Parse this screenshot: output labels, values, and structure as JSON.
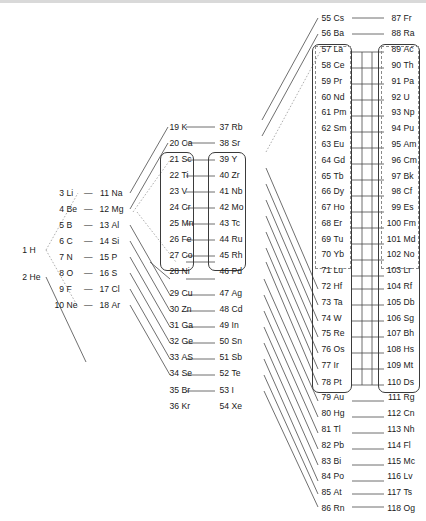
{
  "diagram": {
    "type": "element-chain-diagram",
    "background": "#ffffff",
    "line_color": "#4a4a4a",
    "dashed_line_color": "#9a9a9a",
    "box_color": "#3b3b3b"
  },
  "columns": [
    {
      "id": "col-s1",
      "name": "hydrogen-helium-column",
      "elements": [
        {
          "z": "1",
          "symbol": "H"
        },
        {
          "z": "2",
          "symbol": "He"
        }
      ]
    },
    {
      "id": "col-period2",
      "name": "period-2-column",
      "elements": [
        {
          "z": "3",
          "symbol": "Li"
        },
        {
          "z": "4",
          "symbol": "Be"
        },
        {
          "z": "5",
          "symbol": "B"
        },
        {
          "z": "6",
          "symbol": "C"
        },
        {
          "z": "7",
          "symbol": "N"
        },
        {
          "z": "8",
          "symbol": "O"
        },
        {
          "z": "9",
          "symbol": "F"
        },
        {
          "z": "10",
          "symbol": "Ne"
        }
      ]
    },
    {
      "id": "col-period3",
      "name": "period-3-column",
      "elements": [
        {
          "z": "11",
          "symbol": "Na"
        },
        {
          "z": "12",
          "symbol": "Mg"
        },
        {
          "z": "13",
          "symbol": "Al"
        },
        {
          "z": "14",
          "symbol": "Si"
        },
        {
          "z": "15",
          "symbol": "P"
        },
        {
          "z": "16",
          "symbol": "S"
        },
        {
          "z": "17",
          "symbol": "Cl"
        },
        {
          "z": "18",
          "symbol": "Ar"
        }
      ]
    },
    {
      "id": "col-period4",
      "name": "period-4-column",
      "elements": [
        {
          "z": "19",
          "symbol": "K"
        },
        {
          "z": "20",
          "symbol": "Ca"
        },
        {
          "z": "21",
          "symbol": "Sc"
        },
        {
          "z": "22",
          "symbol": "Ti"
        },
        {
          "z": "23",
          "symbol": "V"
        },
        {
          "z": "24",
          "symbol": "Cr"
        },
        {
          "z": "25",
          "symbol": "Mn"
        },
        {
          "z": "26",
          "symbol": "Fe"
        },
        {
          "z": "27",
          "symbol": "Co"
        },
        {
          "z": "28",
          "symbol": "Ni"
        },
        {
          "z": "29",
          "symbol": "Cu"
        },
        {
          "z": "30",
          "symbol": "Zn"
        },
        {
          "z": "31",
          "symbol": "Ga"
        },
        {
          "z": "32",
          "symbol": "Ge"
        },
        {
          "z": "33",
          "symbol": "AS"
        },
        {
          "z": "34",
          "symbol": "Se"
        },
        {
          "z": "35",
          "symbol": "Br"
        },
        {
          "z": "36",
          "symbol": "Kr"
        }
      ]
    },
    {
      "id": "col-period5",
      "name": "period-5-column",
      "elements": [
        {
          "z": "37",
          "symbol": "Rb"
        },
        {
          "z": "38",
          "symbol": "Sr"
        },
        {
          "z": "39",
          "symbol": "Y"
        },
        {
          "z": "40",
          "symbol": "Zr"
        },
        {
          "z": "41",
          "symbol": "Nb"
        },
        {
          "z": "42",
          "symbol": "Mo"
        },
        {
          "z": "43",
          "symbol": "Tc"
        },
        {
          "z": "44",
          "symbol": "Ru"
        },
        {
          "z": "45",
          "symbol": "Rh"
        },
        {
          "z": "46",
          "symbol": "Pd"
        },
        {
          "z": "47",
          "symbol": "Ag"
        },
        {
          "z": "48",
          "symbol": "Cd"
        },
        {
          "z": "49",
          "symbol": "In"
        },
        {
          "z": "50",
          "symbol": "Sn"
        },
        {
          "z": "51",
          "symbol": "Sb"
        },
        {
          "z": "52",
          "symbol": "Te"
        },
        {
          "z": "53",
          "symbol": "I"
        },
        {
          "z": "54",
          "symbol": "Xe"
        }
      ]
    },
    {
      "id": "col-period6",
      "name": "period-6-column",
      "elements": [
        {
          "z": "55",
          "symbol": "Cs"
        },
        {
          "z": "56",
          "symbol": "Ba"
        },
        {
          "z": "57",
          "symbol": "La"
        },
        {
          "z": "58",
          "symbol": "Ce"
        },
        {
          "z": "59",
          "symbol": "Pr"
        },
        {
          "z": "60",
          "symbol": "Nd"
        },
        {
          "z": "61",
          "symbol": "Pm"
        },
        {
          "z": "62",
          "symbol": "Sm"
        },
        {
          "z": "63",
          "symbol": "Eu"
        },
        {
          "z": "64",
          "symbol": "Gd"
        },
        {
          "z": "65",
          "symbol": "Tb"
        },
        {
          "z": "66",
          "symbol": "Dy"
        },
        {
          "z": "67",
          "symbol": "Ho"
        },
        {
          "z": "68",
          "symbol": "Er"
        },
        {
          "z": "69",
          "symbol": "Tu"
        },
        {
          "z": "70",
          "symbol": "Yb"
        },
        {
          "z": "71",
          "symbol": "Lu"
        },
        {
          "z": "72",
          "symbol": "Hf"
        },
        {
          "z": "73",
          "symbol": "Ta"
        },
        {
          "z": "74",
          "symbol": "W"
        },
        {
          "z": "75",
          "symbol": "Re"
        },
        {
          "z": "76",
          "symbol": "Os"
        },
        {
          "z": "77",
          "symbol": "Ir"
        },
        {
          "z": "78",
          "symbol": "Pt"
        },
        {
          "z": "79",
          "symbol": "Au"
        },
        {
          "z": "80",
          "symbol": "Hg"
        },
        {
          "z": "81",
          "symbol": "Tl"
        },
        {
          "z": "82",
          "symbol": "Pb"
        },
        {
          "z": "83",
          "symbol": "Bi"
        },
        {
          "z": "84",
          "symbol": "Po"
        },
        {
          "z": "85",
          "symbol": "At"
        },
        {
          "z": "86",
          "symbol": "Rn"
        }
      ]
    },
    {
      "id": "col-period7",
      "name": "period-7-column",
      "elements": [
        {
          "z": "87",
          "symbol": "Fr"
        },
        {
          "z": "88",
          "symbol": "Ra"
        },
        {
          "z": "89",
          "symbol": "Ac"
        },
        {
          "z": "90",
          "symbol": "Th"
        },
        {
          "z": "91",
          "symbol": "Pa"
        },
        {
          "z": "92",
          "symbol": "U"
        },
        {
          "z": "93",
          "symbol": "Np"
        },
        {
          "z": "94",
          "symbol": "Pu"
        },
        {
          "z": "95",
          "symbol": "Am"
        },
        {
          "z": "96",
          "symbol": "Cm"
        },
        {
          "z": "97",
          "symbol": "Bk"
        },
        {
          "z": "98",
          "symbol": "Cf"
        },
        {
          "z": "99",
          "symbol": "Es"
        },
        {
          "z": "100",
          "symbol": "Fm"
        },
        {
          "z": "101",
          "symbol": "Md"
        },
        {
          "z": "102",
          "symbol": "No"
        },
        {
          "z": "103",
          "symbol": "Lr"
        },
        {
          "z": "104",
          "symbol": "Rf"
        },
        {
          "z": "105",
          "symbol": "Db"
        },
        {
          "z": "106",
          "symbol": "Sg"
        },
        {
          "z": "107",
          "symbol": "Bh"
        },
        {
          "z": "108",
          "symbol": "Hs"
        },
        {
          "z": "109",
          "symbol": "Mt"
        },
        {
          "z": "110",
          "symbol": "Ds"
        },
        {
          "z": "111",
          "symbol": "Rg"
        },
        {
          "z": "112",
          "symbol": "Cn"
        },
        {
          "z": "113",
          "symbol": "Nh"
        },
        {
          "z": "114",
          "symbol": "Fl"
        },
        {
          "z": "115",
          "symbol": "Mc"
        },
        {
          "z": "116",
          "symbol": "Lv"
        },
        {
          "z": "117",
          "symbol": "Ts"
        },
        {
          "z": "118",
          "symbol": "Og"
        }
      ]
    }
  ],
  "group_boxes": [
    {
      "name": "d-block-box-period4",
      "range": "21 Sc - 28 Ni",
      "style": "solid"
    },
    {
      "name": "d-block-box-period5",
      "range": "39 Y - 46 Pd",
      "style": "solid"
    },
    {
      "name": "d-block-box-period6",
      "range": "57 La - 78 Pt",
      "style": "solid"
    },
    {
      "name": "d-block-box-period7",
      "range": "89 Ac - 110 Ds",
      "style": "solid"
    },
    {
      "name": "f-block-box-lanthanides",
      "range": "57 La - 71 Lu",
      "style": "dashed"
    },
    {
      "name": "f-block-box-actinides",
      "range": "89 Ac - 103 Lr",
      "style": "dashed"
    }
  ],
  "separators": {
    "pair_dash": "—"
  }
}
